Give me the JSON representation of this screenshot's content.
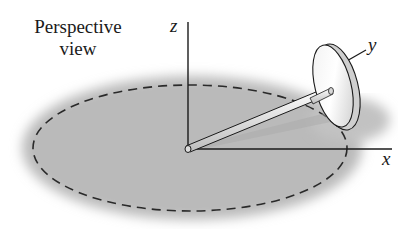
{
  "caption": {
    "line1": "Perspective",
    "line2": "view"
  },
  "axes": {
    "z": "z",
    "y": "y",
    "x": "x"
  },
  "colors": {
    "ground_shadow": "#b9b9b9",
    "lines": "#1a1a1a",
    "disk_face": "#e6e6e6",
    "rod": "#f2f2f2"
  }
}
